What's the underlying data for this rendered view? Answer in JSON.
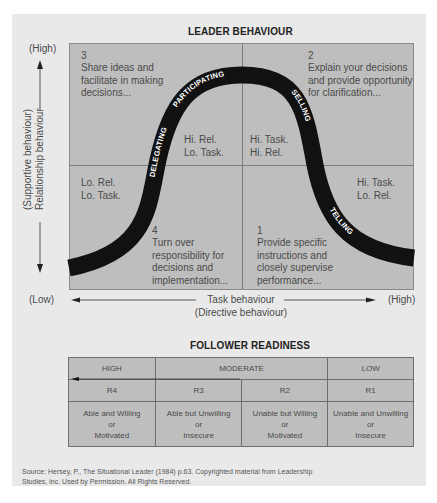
{
  "diagram": {
    "title": "LEADER BEHAVIOUR",
    "y_axis": {
      "high_label": "(High)",
      "low_label": "(Low)",
      "label_line1": "(Supportive behaviour)",
      "label_line2": "Relationship behaviour"
    },
    "x_axis": {
      "low_label": "(Low)",
      "high_label": "(High)",
      "label_line1": "Task behaviour",
      "label_line2": "(Directive behaviour)"
    },
    "quadrants": [
      {
        "id": "q3",
        "number": "3",
        "description": "Share ideas and\nfacilitate in making\ndecisions...",
        "inner": "Hi. Rel.\nLo. Task.",
        "style": "PARTICIPATING"
      },
      {
        "id": "q2",
        "number": "2",
        "description": "Explain your decisions\nand provide opportunity\nfor clarification...",
        "inner": "Hi. Task.\nHi. Rel.",
        "style": "SELLING"
      },
      {
        "id": "q4",
        "number": "4",
        "description": "Turn over\nresponsibility for\ndecisions and\nimplementation...",
        "inner": "Lo. Rel.\nLo. Task.",
        "style": "DELEGATING"
      },
      {
        "id": "q1",
        "number": "1",
        "description": "Provide specific\ninstructions and\nclosely supervise\nperformance...",
        "inner": "Hi. Task.\nLo. Rel.",
        "style": "TELLING"
      }
    ],
    "curve_labels": {
      "participating": "PARTICIPATING",
      "selling": "SELLING",
      "delegating": "DELEGATING",
      "telling": "TELLING"
    }
  },
  "readiness": {
    "title": "FOLLOWER READINESS",
    "levels": [
      {
        "label": "HIGH"
      },
      {
        "label": "MODERATE"
      },
      {
        "label": "LOW"
      }
    ],
    "codes": [
      "R4",
      "R3",
      "R2",
      "R1"
    ],
    "descriptions": [
      {
        "line1": "Able and Willing",
        "line2": "or",
        "line3": "Motivated"
      },
      {
        "line1": "Able but Unwilling",
        "line2": "or",
        "line3": "Insecure"
      },
      {
        "line1": "Unable but Willing",
        "line2": "or",
        "line3": "Motivated"
      },
      {
        "line1": "Unable and Unwilling",
        "line2": "or",
        "line3": "Insecure"
      }
    ]
  },
  "source": {
    "line1": "Source: Hersey, P., The Situational Leader (1984) p.63. Copyrighted material from Leadership",
    "line2": "Studies, inc. Used by Permission. All Rights Reserved."
  },
  "colors": {
    "panel_bg": "#e9e9e9",
    "quadrant_fill": "#bebebe",
    "curve": "#111111",
    "grid_line": "#7d7d7d"
  }
}
